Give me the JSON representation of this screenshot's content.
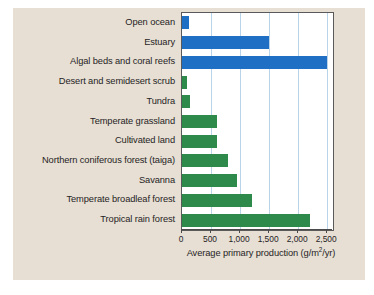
{
  "figure": {
    "background_color": "#e7dfd3",
    "plot_background_color": "#ffffff",
    "marine_color": "#1f6fc4",
    "terrestrial_color": "#2d8a4a",
    "gridline_color": "#b9d4e8"
  },
  "chart_data": {
    "type": "bar",
    "orientation": "horizontal",
    "title": "",
    "xlabel": "Average primary production (g/m2/yr)",
    "xlabel_parts": {
      "before": "Average primary production (g/m",
      "superscript": "2",
      "after": "/yr)"
    },
    "ylabel": "",
    "xlim": [
      0,
      2600
    ],
    "grid": true,
    "grid_axis": "x",
    "legend": "none",
    "categories": [
      "Open ocean",
      "Estuary",
      "Algal beds and coral reefs",
      "Desert and semidesert scrub",
      "Tundra",
      "Temperate grassland",
      "Cultivated land",
      "Northern coniferous forest (taiga)",
      "Savanna",
      "Temperate broadleaf forest",
      "Tropical rain forest"
    ],
    "values": [
      125,
      1500,
      2500,
      90,
      140,
      600,
      600,
      800,
      950,
      1200,
      2200
    ],
    "bar_colors": [
      "marine",
      "marine",
      "marine",
      "terrestrial",
      "terrestrial",
      "terrestrial",
      "terrestrial",
      "terrestrial",
      "terrestrial",
      "terrestrial",
      "terrestrial"
    ],
    "xticks": [
      0,
      500,
      1000,
      1500,
      2000,
      2500
    ],
    "xtick_labels": [
      "0",
      "500",
      "1,000",
      "1,500",
      "2,000",
      "2,500"
    ]
  }
}
